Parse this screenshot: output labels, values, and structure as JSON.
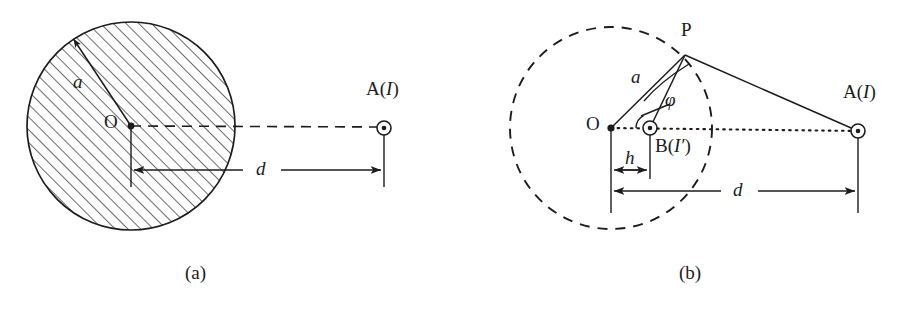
{
  "figure": {
    "type": "technical-diagram",
    "background_color": "#ffffff",
    "stroke_color": "#1c1c1c",
    "panels": [
      {
        "id": "a",
        "caption": "(a)",
        "caption_x": 194,
        "caption_y": 275,
        "circle": {
          "name": "hatched-cylinder",
          "cx": 131,
          "cy": 126,
          "r": 104,
          "style": "solid-outline-hatched",
          "hatch_angle_deg": 45,
          "hatch_spacing": 9
        },
        "points": [
          {
            "name": "O",
            "label": "O",
            "label_x": 104,
            "label_y": 117,
            "x": 131,
            "y": 126,
            "marker": "dot"
          },
          {
            "name": "A",
            "label_prefix": "A(",
            "label_italic": "I",
            "label_suffix": ")",
            "label_x": 366,
            "label_y": 89,
            "x": 384,
            "y": 128,
            "marker": "circle-dot"
          }
        ],
        "lines": [
          {
            "name": "axis-O-to-A",
            "style": "dashed",
            "x1": 131,
            "y1": 126,
            "x2": 384,
            "y2": 127
          }
        ],
        "extension_lines": [
          {
            "name": "ext-O",
            "x": 131,
            "y1": 126,
            "y2": 186
          },
          {
            "name": "ext-A",
            "x": 384,
            "y1": 128,
            "y2": 186
          }
        ],
        "dimensions": [
          {
            "name": "d",
            "label": "d",
            "label_x": 256,
            "label_y": 160,
            "y": 170,
            "x1": 131,
            "x2": 384
          }
        ]
      },
      {
        "id": "b",
        "caption": "(b)",
        "caption_x": 688,
        "caption_y": 275,
        "circle": {
          "name": "dashed-boundary-circle",
          "cx": 611,
          "cy": 128,
          "r": 101,
          "style": "dashed-outline",
          "dash": "9 7"
        },
        "points": [
          {
            "name": "O",
            "label": "O",
            "label_x": 586,
            "label_y": 118,
            "x": 611,
            "y": 128,
            "marker": "dot"
          },
          {
            "name": "P",
            "label": "P",
            "label_x": 680,
            "label_y": 20,
            "x": 685,
            "y": 55,
            "marker": "none"
          },
          {
            "name": "B",
            "label_prefix": "B(",
            "label_italic": "I′",
            "label_suffix": ")",
            "label_x": 654,
            "label_y": 136,
            "x": 650,
            "y": 128,
            "marker": "circle-dot"
          },
          {
            "name": "A",
            "label_prefix": "A(",
            "label_italic": "I",
            "label_suffix": ")",
            "label_x": 843,
            "label_y": 92,
            "x": 858,
            "y": 131,
            "marker": "circle-dot"
          }
        ],
        "lines": [
          {
            "name": "axis-O-to-A",
            "style": "dotted",
            "x1": 611,
            "y1": 128,
            "x2": 858,
            "y2": 131
          },
          {
            "name": "radius-O-to-P",
            "style": "solid",
            "x1": 611,
            "y1": 128,
            "x2": 685,
            "y2": 55
          },
          {
            "name": "segment-B-to-P",
            "style": "solid",
            "x1": 650,
            "y1": 128,
            "x2": 685,
            "y2": 55
          },
          {
            "name": "segment-P-to-A",
            "style": "solid",
            "x1": 685,
            "y1": 55,
            "x2": 858,
            "y2": 131
          }
        ],
        "leaders": [
          {
            "name": "leader-a",
            "from_x": 651,
            "from_y": 98,
            "to_x": 690,
            "to_y": 66
          },
          {
            "name": "leader-phi",
            "from_x": 668,
            "from_y": 104,
            "to_x": 640,
            "to_y": 118
          }
        ],
        "angle_arc": {
          "name": "angle-phi-at-B",
          "vertex_x": 650,
          "vertex_y": 128,
          "radius": 14,
          "label": "φ"
        },
        "extension_lines": [
          {
            "name": "ext-O",
            "x": 611,
            "y1": 128,
            "y2": 212
          },
          {
            "name": "ext-B",
            "x": 650,
            "y1": 128,
            "y2": 178
          },
          {
            "name": "ext-A",
            "x": 858,
            "y1": 131,
            "y2": 212
          }
        ],
        "dimensions": [
          {
            "name": "h",
            "label": "h",
            "label_x": 625,
            "label_y": 149,
            "y": 170,
            "x1": 611,
            "x2": 650
          },
          {
            "name": "d",
            "label": "d",
            "label_x": 734,
            "label_y": 181,
            "y": 191,
            "x1": 611,
            "x2": 858
          }
        ],
        "labels": [
          {
            "name": "radius-label-a",
            "text": "a",
            "x": 631,
            "y": 72,
            "italic": true
          },
          {
            "name": "angle-label-phi",
            "text": "φ",
            "x": 666,
            "y": 94,
            "italic": true
          }
        ]
      }
    ],
    "symbols": {
      "circle_dot_outer_r": 7,
      "circle_dot_inner_r": 2.2,
      "point_dot_r": 3.4
    }
  }
}
